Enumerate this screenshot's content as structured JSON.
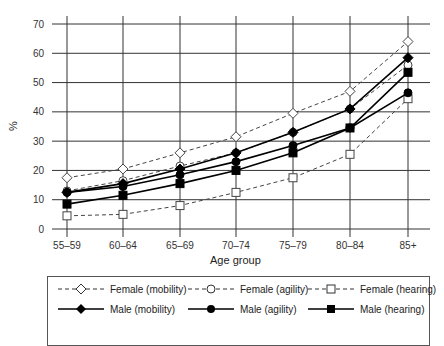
{
  "chart_data": {
    "type": "line",
    "title": "",
    "xlabel": "Age group",
    "ylabel": "%",
    "ylim": [
      0,
      70
    ],
    "yticks": [
      0,
      10,
      20,
      30,
      40,
      50,
      60,
      70
    ],
    "grid": true,
    "legend_position": "bottom",
    "categories": [
      "55–59",
      "60–64",
      "65–69",
      "70–74",
      "75–79",
      "80–84",
      "85+"
    ],
    "series": [
      {
        "name": "Female (mobility)",
        "style": "dashed",
        "marker": "open-diamond",
        "values": [
          17.5,
          20.5,
          26,
          31.5,
          39.5,
          47,
          64
        ]
      },
      {
        "name": "Female (agility)",
        "style": "dashed",
        "marker": "open-circle",
        "values": [
          13,
          16.5,
          21.5,
          26,
          33,
          41,
          56
        ]
      },
      {
        "name": "Female (hearing)",
        "style": "dashed",
        "marker": "open-square",
        "values": [
          4.5,
          5,
          8,
          12.5,
          17.5,
          25.5,
          44.5
        ]
      },
      {
        "name": "Male (mobility)",
        "style": "solid",
        "marker": "filled-diamond",
        "values": [
          12.5,
          15.5,
          20.5,
          26,
          33,
          41,
          58.5
        ]
      },
      {
        "name": "Male (agility)",
        "style": "solid",
        "marker": "filled-circle",
        "values": [
          12.5,
          14.5,
          18.5,
          23,
          28.5,
          34.5,
          46.5
        ]
      },
      {
        "name": "Male (hearing)",
        "style": "solid",
        "marker": "filled-square",
        "values": [
          8.5,
          11.5,
          15.5,
          20,
          26,
          34.5,
          53.5
        ]
      }
    ]
  },
  "axis": {
    "xlabel": "Age group",
    "ylabel": "%"
  },
  "legend": {
    "items": [
      "Female (mobility)",
      "Female (agility)",
      "Female (hearing)",
      "Male (mobility)",
      "Male (agility)",
      "Male (hearing)"
    ]
  }
}
